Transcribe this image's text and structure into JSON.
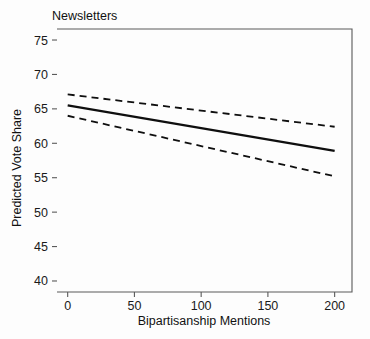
{
  "chart_data": {
    "type": "line",
    "title": "Newsletters",
    "xlabel": "Bipartisanship Mentions",
    "ylabel": "Predicted Vote Share",
    "xlim": [
      -8,
      213
    ],
    "ylim": [
      38.4,
      76.6
    ],
    "grid": false,
    "legend": "none",
    "xticks": [
      0,
      50,
      100,
      150,
      200
    ],
    "xtick_labels": [
      "0",
      "50",
      "100",
      "150",
      "200"
    ],
    "yticks": [
      40,
      45,
      50,
      55,
      60,
      65,
      70,
      75
    ],
    "ytick_labels": [
      "40",
      "45",
      "50",
      "55",
      "60",
      "65",
      "70",
      "75"
    ],
    "x": [
      0,
      200
    ],
    "series": [
      {
        "name": "Predicted vote share (fit)",
        "style": "solid",
        "values": [
          65.5,
          58.9
        ]
      },
      {
        "name": "Upper 95% confidence bound",
        "style": "dashed",
        "values": [
          67.1,
          62.4
        ]
      },
      {
        "name": "Lower 95% confidence bound",
        "style": "dashed",
        "values": [
          64.0,
          55.2
        ]
      }
    ],
    "colors": {
      "fit_line": "#0f0f0f",
      "ci_line": "#0f0f0f",
      "axis": "#5a5a5a",
      "text": "#111111",
      "background": "#fdfdfd"
    }
  }
}
